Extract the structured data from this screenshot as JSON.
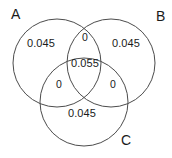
{
  "diagram": {
    "type": "venn3",
    "background_color": "#ffffff",
    "stroke_color": "#4c4c4c",
    "text_color": "#1a1a1a",
    "sets": [
      {
        "key": "A",
        "label": "A",
        "cx": 57,
        "cy": 63,
        "r": 44
      },
      {
        "key": "B",
        "label": "B",
        "cx": 111,
        "cy": 63,
        "r": 44
      },
      {
        "key": "C",
        "label": "C",
        "cx": 84,
        "cy": 102,
        "r": 44
      }
    ],
    "regions": [
      {
        "key": "a_only",
        "label": "A only",
        "value": "0.045"
      },
      {
        "key": "b_only",
        "label": "B only",
        "value": "0.045"
      },
      {
        "key": "c_only",
        "label": "C only",
        "value": "0.045"
      },
      {
        "key": "ab",
        "label": "A and B",
        "value": "0"
      },
      {
        "key": "ac",
        "label": "A and C",
        "value": "0"
      },
      {
        "key": "bc",
        "label": "B and C",
        "value": "0"
      },
      {
        "key": "abc",
        "label": "A and B and C",
        "value": "0.055"
      }
    ]
  },
  "chart_data": {
    "type": "venn",
    "title": "",
    "set_labels": [
      "A",
      "B",
      "C"
    ],
    "region_labels": [
      "A only",
      "A∩B only",
      "B only",
      "A∩C only",
      "A∩B∩C",
      "B∩C only",
      "C only"
    ],
    "region_values": [
      0.045,
      0,
      0.045,
      0,
      0.055,
      0,
      0.045
    ],
    "region_value_text": [
      "0.045",
      "0",
      "0.045",
      "0",
      "0.055",
      "0",
      "0.045"
    ]
  }
}
